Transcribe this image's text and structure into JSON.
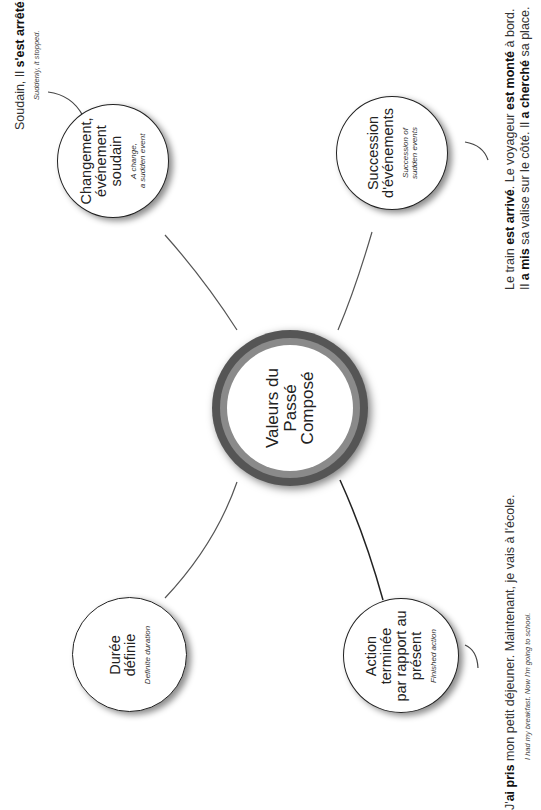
{
  "center": {
    "lines": [
      "Valeurs du",
      "Passé",
      "Composé"
    ]
  },
  "nodes": {
    "changement": {
      "lines": [
        "Changement,",
        "événement",
        "soudain"
      ],
      "sub": [
        "A change,",
        "a sudden event"
      ]
    },
    "succession": {
      "lines": [
        "Succession",
        "d'événements"
      ],
      "sub": [
        "Succession of",
        "sudden events"
      ]
    },
    "duree": {
      "lines": [
        "Durée",
        "définie"
      ],
      "sub": [
        "Definite duration"
      ]
    },
    "action": {
      "lines": [
        "Action",
        "terminée",
        "par rapport au",
        "présent"
      ],
      "sub": [
        "Finished action"
      ]
    }
  },
  "examples": {
    "soudain": {
      "fr_parts": [
        "Soudain, Il ",
        "s'est arrêté",
        "."
      ],
      "en": "Suddenly, it stopped."
    },
    "train": {
      "line1_parts": [
        "Le train ",
        "est arrivé",
        ". Le voyageur ",
        "est monté",
        " à bord."
      ],
      "line2_parts": [
        "Il ",
        "a mis",
        " sa valise sur le côté. Il ",
        "a cherché",
        " sa place."
      ]
    },
    "dejeuner": {
      "fr_parts": [
        "J'",
        "ai pris",
        " mon petit déjeuner. Maintenant, je vais à l'école."
      ],
      "en": "I had my breakfast. Now I'm going to school."
    }
  },
  "colors": {
    "ring_outer": "#555555",
    "ring_inner": "#8a8a8a",
    "line": "#555555"
  }
}
